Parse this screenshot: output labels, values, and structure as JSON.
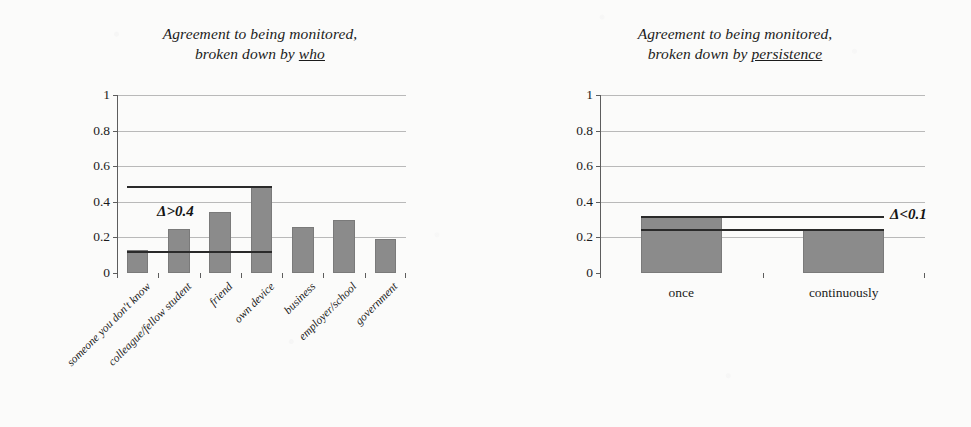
{
  "chart_data": [
    {
      "type": "bar",
      "panel": "left",
      "title_line1": "Agreement to being monitored,",
      "title_line2_prefix": "broken down by ",
      "title_line2_emph": "who",
      "xlabel": "",
      "ylabel": "",
      "ylim": [
        0,
        1
      ],
      "yticks": [
        "0",
        "0.2",
        "0.4",
        "0.6",
        "0.8",
        "1"
      ],
      "ytick_values": [
        0,
        0.2,
        0.4,
        0.6,
        0.8,
        1
      ],
      "grid": true,
      "legend": "none",
      "categories": [
        "someone you don't know",
        "colleague/fellow student",
        "friend",
        "own device",
        "business",
        "employer/school",
        "government"
      ],
      "values": [
        0.13,
        0.25,
        0.34,
        0.49,
        0.26,
        0.3,
        0.19
      ],
      "annotation": {
        "label": "Δ>0.4",
        "upper_line_value": 0.49,
        "lower_line_value": 0.125,
        "span_from_category": "someone you don't know",
        "span_to_category": "own device"
      }
    },
    {
      "type": "bar",
      "panel": "right",
      "title_line1": "Agreement to being monitored,",
      "title_line2_prefix": "broken down by ",
      "title_line2_emph": "persistence",
      "xlabel": "",
      "ylabel": "",
      "ylim": [
        0,
        1
      ],
      "yticks": [
        "0",
        "0.2",
        "0.4",
        "0.6",
        "0.8",
        "1"
      ],
      "ytick_values": [
        0,
        0.2,
        0.4,
        0.6,
        0.8,
        1
      ],
      "grid": true,
      "legend": "none",
      "categories": [
        "once",
        "continuously"
      ],
      "values": [
        0.32,
        0.25
      ],
      "annotation": {
        "label": "Δ<0.1",
        "upper_line_value": 0.32,
        "lower_line_value": 0.25,
        "span_from_category": "once",
        "span_to_category": "continuously"
      }
    }
  ],
  "style": {
    "bar_color": "#8b8b8b",
    "bar_edge_color": "#7a7a7a",
    "grid_color": "#b9b9b9",
    "axis_color": "#5d5d5d",
    "text_color": "#1b1b1b",
    "annotation_color": "#2a2a2a",
    "background": "#fbfbfa"
  }
}
